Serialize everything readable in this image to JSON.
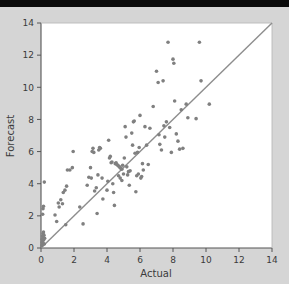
{
  "figure": {
    "background_color": "#d5d5d5",
    "top_band_color": "#0a0a0a",
    "plot_background_color": "#ffffff"
  },
  "chart_data": {
    "type": "scatter",
    "title": "",
    "xlabel": "Actual",
    "ylabel": "Forecast",
    "xlim": [
      0,
      14
    ],
    "ylim": [
      0,
      14
    ],
    "xticks": [
      0,
      2,
      4,
      6,
      8,
      10,
      12,
      14
    ],
    "yticks": [
      0,
      2,
      4,
      6,
      8,
      10,
      12,
      14
    ],
    "xtick_labels": [
      "0",
      "2",
      "4",
      "6",
      "8",
      "10",
      "12",
      "14"
    ],
    "ytick_labels": [
      "0",
      "2",
      "4",
      "6",
      "8",
      "10",
      "12",
      "14"
    ],
    "grid": false,
    "legend": null,
    "marker_color": "#808080",
    "marker_size": 3.6,
    "reference_line": {
      "name": "one-to-one-line",
      "from": [
        0,
        0
      ],
      "to": [
        14,
        14
      ],
      "color": "#8d8d8d",
      "width": 1.4
    },
    "series": [
      {
        "name": "forecast-vs-actual",
        "points": [
          [
            0.05,
            0.15
          ],
          [
            0.06,
            0.35
          ],
          [
            0.07,
            0.55
          ],
          [
            0.08,
            0.2
          ],
          [
            0.09,
            0.75
          ],
          [
            0.1,
            0.45
          ],
          [
            0.12,
            0.9
          ],
          [
            0.13,
            0.3
          ],
          [
            0.14,
            0.65
          ],
          [
            0.15,
            1.0
          ],
          [
            0.16,
            0.5
          ],
          [
            0.18,
            0.8
          ],
          [
            0.2,
            0.25
          ],
          [
            0.22,
            0.6
          ],
          [
            0.1,
            2.1
          ],
          [
            0.12,
            2.45
          ],
          [
            0.15,
            2.6
          ],
          [
            0.2,
            4.1
          ],
          [
            0.85,
            2.05
          ],
          [
            0.95,
            1.65
          ],
          [
            1.05,
            2.8
          ],
          [
            1.1,
            2.55
          ],
          [
            1.2,
            3.0
          ],
          [
            1.3,
            2.75
          ],
          [
            1.35,
            3.45
          ],
          [
            1.45,
            3.6
          ],
          [
            1.5,
            1.45
          ],
          [
            1.6,
            4.85
          ],
          [
            1.75,
            4.85
          ],
          [
            1.9,
            5.0
          ],
          [
            1.95,
            6.0
          ],
          [
            1.55,
            3.85
          ],
          [
            2.35,
            2.55
          ],
          [
            2.55,
            1.5
          ],
          [
            2.8,
            3.9
          ],
          [
            2.9,
            4.4
          ],
          [
            3.0,
            5.0
          ],
          [
            3.05,
            4.35
          ],
          [
            3.1,
            6.0
          ],
          [
            3.15,
            6.2
          ],
          [
            3.2,
            5.95
          ],
          [
            3.25,
            3.55
          ],
          [
            3.35,
            3.75
          ],
          [
            3.4,
            2.15
          ],
          [
            3.45,
            4.55
          ],
          [
            3.5,
            6.1
          ],
          [
            3.55,
            6.25
          ],
          [
            3.6,
            6.2
          ],
          [
            3.7,
            4.35
          ],
          [
            3.75,
            3.05
          ],
          [
            4.0,
            3.6
          ],
          [
            4.05,
            4.15
          ],
          [
            4.1,
            6.7
          ],
          [
            4.15,
            5.6
          ],
          [
            4.2,
            5.7
          ],
          [
            4.25,
            5.3
          ],
          [
            4.3,
            5.35
          ],
          [
            4.35,
            4.0
          ],
          [
            4.4,
            3.45
          ],
          [
            4.45,
            2.65
          ],
          [
            4.5,
            5.25
          ],
          [
            4.55,
            5.3
          ],
          [
            4.6,
            5.2
          ],
          [
            4.65,
            5.15
          ],
          [
            4.7,
            5.1
          ],
          [
            4.75,
            5.05
          ],
          [
            4.8,
            5.0
          ],
          [
            4.85,
            4.95
          ],
          [
            4.9,
            4.9
          ],
          [
            4.95,
            5.15
          ],
          [
            4.7,
            4.5
          ],
          [
            4.8,
            4.35
          ],
          [
            4.9,
            4.2
          ],
          [
            5.0,
            4.6
          ],
          [
            5.05,
            5.6
          ],
          [
            5.1,
            7.55
          ],
          [
            5.15,
            6.9
          ],
          [
            5.2,
            5.05
          ],
          [
            5.25,
            4.55
          ],
          [
            5.3,
            4.75
          ],
          [
            5.35,
            3.9
          ],
          [
            5.4,
            4.8
          ],
          [
            5.5,
            7.15
          ],
          [
            5.55,
            6.4
          ],
          [
            5.6,
            7.85
          ],
          [
            5.65,
            7.9
          ],
          [
            5.7,
            5.9
          ],
          [
            5.75,
            3.5
          ],
          [
            5.8,
            4.5
          ],
          [
            5.85,
            5.95
          ],
          [
            5.9,
            4.6
          ],
          [
            5.95,
            6.25
          ],
          [
            6.0,
            8.25
          ],
          [
            6.05,
            4.35
          ],
          [
            6.1,
            4.45
          ],
          [
            6.15,
            5.25
          ],
          [
            6.2,
            4.85
          ],
          [
            6.3,
            7.55
          ],
          [
            6.4,
            6.4
          ],
          [
            6.5,
            5.2
          ],
          [
            6.6,
            7.45
          ],
          [
            6.8,
            8.8
          ],
          [
            7.0,
            11.0
          ],
          [
            7.1,
            10.3
          ],
          [
            7.15,
            7.05
          ],
          [
            7.2,
            6.45
          ],
          [
            7.3,
            6.1
          ],
          [
            7.4,
            10.4
          ],
          [
            7.45,
            7.6
          ],
          [
            7.5,
            6.9
          ],
          [
            7.6,
            7.85
          ],
          [
            7.7,
            12.8
          ],
          [
            7.8,
            7.5
          ],
          [
            7.9,
            5.95
          ],
          [
            8.0,
            11.75
          ],
          [
            8.05,
            11.5
          ],
          [
            8.1,
            9.15
          ],
          [
            8.2,
            7.1
          ],
          [
            8.3,
            6.65
          ],
          [
            8.4,
            6.15
          ],
          [
            8.5,
            8.6
          ],
          [
            8.6,
            6.2
          ],
          [
            8.8,
            8.95
          ],
          [
            8.9,
            8.1
          ],
          [
            9.4,
            8.05
          ],
          [
            9.6,
            12.8
          ],
          [
            9.7,
            10.4
          ],
          [
            10.2,
            8.95
          ]
        ]
      }
    ]
  }
}
